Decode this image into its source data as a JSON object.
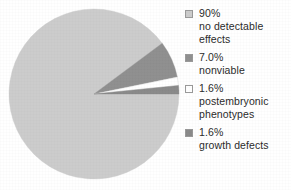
{
  "chart_data": {
    "type": "pie",
    "title": "",
    "xlabel": "",
    "ylabel": "",
    "legend_position": "right",
    "grid": false,
    "categories": [
      "no detectable effects",
      "nonviable",
      "postembryonic phenotypes",
      "growth defects"
    ],
    "values": [
      90,
      7.0,
      1.6,
      1.6
    ],
    "value_labels": [
      "90%",
      "7.0%",
      "1.6%",
      "1.6%"
    ],
    "colors": [
      "#cccccc",
      "#909090",
      "#ffffff",
      "#8a8a8a"
    ],
    "slices": [
      {
        "percent_label": "90%",
        "name": "no detectable effects",
        "value": 90,
        "color": "#cccccc"
      },
      {
        "percent_label": "7.0%",
        "name": "nonviable",
        "value": 7.0,
        "color": "#909090"
      },
      {
        "percent_label": "1.6%",
        "name": "postembryonic phenotypes",
        "value": 1.6,
        "color": "#ffffff"
      },
      {
        "percent_label": "1.6%",
        "name": "growth defects",
        "value": 1.6,
        "color": "#8a8a8a"
      }
    ]
  },
  "legend": {
    "items": [
      {
        "swatch_color": "#cccccc",
        "label": "90%\nno detectable\neffects"
      },
      {
        "swatch_color": "#909090",
        "label": "7.0%\nnonviable"
      },
      {
        "swatch_color": "#ffffff",
        "label": "1.6%\npostembryonic\nphenotypes"
      },
      {
        "swatch_color": "#8a8a8a",
        "label": "1.6%\ngrowth defects"
      }
    ]
  }
}
